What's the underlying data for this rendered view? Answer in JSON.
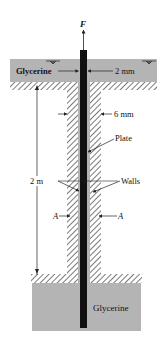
{
  "figure": {
    "force_label": "F",
    "top_fluid_label": "Glycerine",
    "bottom_fluid_label": "Glycerine",
    "gap_top_dimension": "2 mm",
    "wall_gap_dimension": "6 mm",
    "length_dimension": "2 m",
    "plate_label": "Plate",
    "walls_label": "Walls",
    "section_marker_left": "A",
    "section_marker_right": "A"
  },
  "colors": {
    "glycerine": "#b4b4b4",
    "plate": "#111111",
    "hatch": "#333333",
    "line": "#222222",
    "background": "#ffffff"
  }
}
